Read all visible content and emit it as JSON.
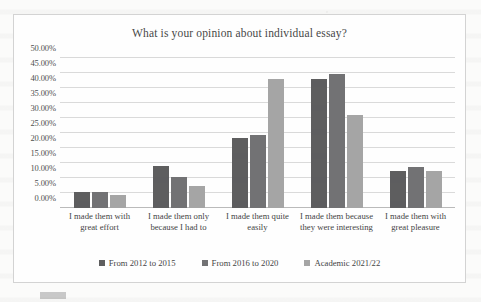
{
  "chart_data": {
    "type": "bar",
    "title": "What is your opinion about individual essay?",
    "xlabel": "",
    "ylabel": "",
    "ylim": [
      0,
      50
    ],
    "grid": true,
    "legend_position": "bottom",
    "y_ticks": [
      "0.00%",
      "5.00%",
      "10.00%",
      "15.00%",
      "20.00%",
      "25.00%",
      "30.00%",
      "35.00%",
      "40.00%",
      "45.00%",
      "50.00%"
    ],
    "y_tick_values": [
      0,
      5,
      10,
      15,
      20,
      25,
      30,
      35,
      40,
      45,
      50
    ],
    "categories": [
      "I made them with great effort",
      "I made them only because I had to",
      "I made them quite easily",
      "I made them because they were interesting",
      "I made them with great pleasure"
    ],
    "series": [
      {
        "name": "From 2012 to 2015",
        "color": "#59595b",
        "values": [
          5.4,
          14.0,
          23.5,
          43.0,
          12.4
        ]
      },
      {
        "name": "From 2016 to 2020",
        "color": "#6e6e70",
        "values": [
          5.2,
          10.4,
          24.4,
          44.8,
          13.6
        ]
      },
      {
        "name": "Academic 2021/22",
        "color": "#a3a3a3",
        "values": [
          4.3,
          7.3,
          43.0,
          31.1,
          12.4
        ]
      }
    ]
  }
}
